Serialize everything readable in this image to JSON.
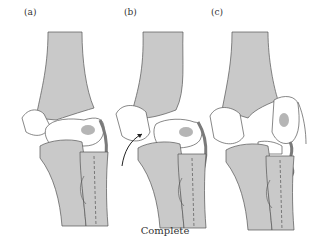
{
  "figure": {
    "caption": "Complete",
    "panels": [
      {
        "label": "(a)",
        "description": "elbow joint, intact alignment with lateral ligament"
      },
      {
        "label": "(b)",
        "description": "elbow joint with arrow indicating displacement"
      },
      {
        "label": "(c)",
        "description": "elbow joint, complete dislocation with torn ligament"
      }
    ]
  },
  "colors": {
    "bone_gray": "#c9c9c9",
    "bone_white": "#ffffff",
    "ligament": "#7a7a7a",
    "outline": "#555555",
    "nucleus": "#b5b5b5"
  }
}
